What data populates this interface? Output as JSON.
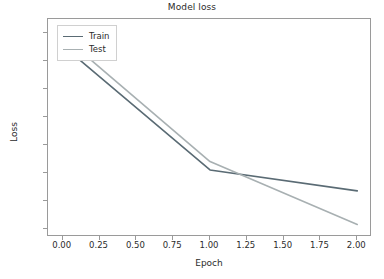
{
  "chart_data": {
    "type": "line",
    "title": "Model loss",
    "xlabel": "Epoch",
    "ylabel": "Loss",
    "xlim": [
      -0.1,
      2.1
    ],
    "ylim": [
      0.07,
      0.85
    ],
    "grid": false,
    "legend_position": "upper left",
    "xticks": [
      "0.00",
      "0.25",
      "0.50",
      "0.75",
      "1.00",
      "1.25",
      "1.50",
      "1.75",
      "2.00"
    ],
    "xtick_values": [
      0.0,
      0.25,
      0.5,
      0.75,
      1.0,
      1.25,
      1.5,
      1.75,
      2.0
    ],
    "yticks": [
      "0.1",
      "0.2",
      "0.3",
      "0.4",
      "0.5",
      "0.6",
      "0.7",
      "0.8"
    ],
    "ytick_values": [
      0.1,
      0.2,
      0.3,
      0.4,
      0.5,
      0.6,
      0.7,
      0.8
    ],
    "x": [
      0,
      1,
      2
    ],
    "series": [
      {
        "name": "Train",
        "color": "#5a6b74",
        "values": [
          0.755,
          0.31,
          0.235
        ]
      },
      {
        "name": "Test",
        "color": "#a8b0b2",
        "values": [
          0.79,
          0.34,
          0.115
        ]
      }
    ]
  },
  "legend": {
    "entries": [
      {
        "label": "Train"
      },
      {
        "label": "Test"
      }
    ]
  }
}
